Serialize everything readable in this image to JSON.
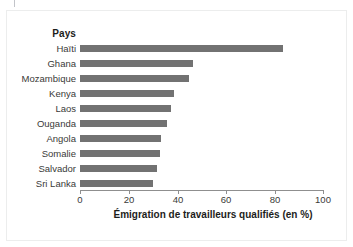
{
  "figure": {
    "cropped_title_remnant": "",
    "category_header": "Pays",
    "colors": {
      "bar": "#727272",
      "axis": "#8f8f8f",
      "text": "#3a3a38",
      "header_text": "#1d1d1b",
      "background": "#ffffff",
      "frame": "#eceded"
    }
  },
  "chart_data": {
    "type": "bar",
    "orientation": "horizontal",
    "title": "",
    "categories": [
      "Haïti",
      "Ghana",
      "Mozambique",
      "Kenya",
      "Laos",
      "Ouganda",
      "Angola",
      "Somalie",
      "Salvador",
      "Sri Lanka"
    ],
    "values": [
      83.5,
      46.5,
      45,
      38.5,
      37.5,
      36,
      33.5,
      33,
      31.5,
      30
    ],
    "category_axis_label": "Pays",
    "xlabel": "Émigration de travailleurs qualifiés (en %)",
    "ylabel": "",
    "xlim": [
      0,
      100
    ],
    "xticks": [
      0,
      20,
      40,
      60,
      80,
      100
    ],
    "xtick_labels": [
      "0",
      "20",
      "40",
      "60",
      "80",
      "100"
    ],
    "grid": false,
    "legend": null,
    "units": "%"
  }
}
